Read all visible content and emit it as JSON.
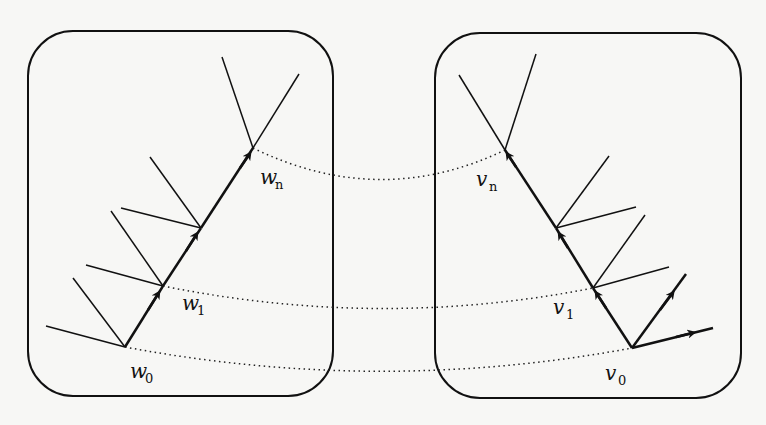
{
  "diagram": {
    "type": "two-panel correspondence diagram",
    "panels": [
      {
        "id": "left",
        "chain_labels": [
          {
            "base": "w",
            "sub": "0"
          },
          {
            "base": "w",
            "sub": "1"
          },
          {
            "base": "w",
            "sub": "n"
          }
        ]
      },
      {
        "id": "right",
        "chain_labels": [
          {
            "base": "v",
            "sub": "0"
          },
          {
            "base": "v",
            "sub": "1"
          },
          {
            "base": "v",
            "sub": "n"
          }
        ]
      }
    ],
    "connections": [
      {
        "from": "w0",
        "to": "v0",
        "style": "dotted"
      },
      {
        "from": "w1",
        "to": "v1",
        "style": "dotted"
      },
      {
        "from": "wn",
        "to": "vn",
        "style": "dotted"
      }
    ],
    "colors": {
      "stroke": "#111111",
      "background": "#f7f7f5"
    }
  }
}
